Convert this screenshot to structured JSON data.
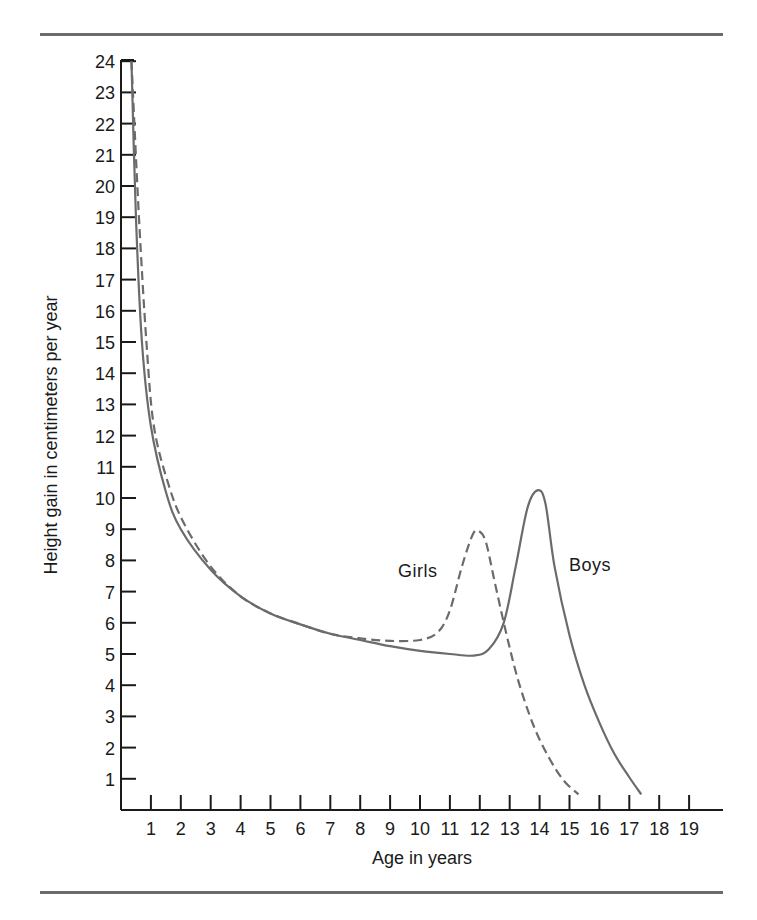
{
  "chart_data": {
    "type": "line",
    "title": "",
    "xlabel": "Age in years",
    "ylabel": "Height gain in centimeters per year",
    "xlim": [
      0,
      20
    ],
    "ylim": [
      0,
      24
    ],
    "x_ticks": [
      1,
      2,
      3,
      4,
      5,
      6,
      7,
      8,
      9,
      10,
      11,
      12,
      13,
      14,
      15,
      16,
      17,
      18,
      19
    ],
    "y_ticks": [
      1,
      2,
      3,
      4,
      5,
      6,
      7,
      8,
      9,
      10,
      11,
      12,
      13,
      14,
      15,
      16,
      17,
      18,
      19,
      20,
      21,
      22,
      23,
      24
    ],
    "grid": false,
    "legend": "inline labels",
    "series": [
      {
        "name": "Boys",
        "style": "solid",
        "color": "#6b6b6b",
        "label_pos": {
          "x": 15.8,
          "y": 7.6
        },
        "points": [
          [
            0.35,
            24
          ],
          [
            0.5,
            19
          ],
          [
            0.7,
            15
          ],
          [
            1.0,
            12.3
          ],
          [
            1.5,
            10.2
          ],
          [
            2.0,
            9.0
          ],
          [
            3.0,
            7.7
          ],
          [
            4.0,
            6.85
          ],
          [
            5.0,
            6.3
          ],
          [
            6.0,
            5.95
          ],
          [
            7.0,
            5.65
          ],
          [
            8.0,
            5.45
          ],
          [
            9.0,
            5.25
          ],
          [
            10.0,
            5.1
          ],
          [
            11.0,
            5.0
          ],
          [
            11.8,
            4.95
          ],
          [
            12.3,
            5.15
          ],
          [
            12.8,
            6.0
          ],
          [
            13.2,
            7.8
          ],
          [
            13.6,
            9.7
          ],
          [
            13.95,
            10.25
          ],
          [
            14.2,
            9.8
          ],
          [
            14.5,
            7.8
          ],
          [
            15.0,
            5.6
          ],
          [
            15.5,
            4.0
          ],
          [
            16.0,
            2.8
          ],
          [
            16.5,
            1.8
          ],
          [
            17.0,
            1.05
          ],
          [
            17.4,
            0.5
          ]
        ]
      },
      {
        "name": "Girls",
        "style": "dashed",
        "color": "#6b6b6b",
        "label_pos": {
          "x": 9.3,
          "y": 7.6
        },
        "points": [
          [
            0.35,
            24
          ],
          [
            0.6,
            19
          ],
          [
            0.85,
            15
          ],
          [
            1.1,
            12.3
          ],
          [
            1.6,
            10.4
          ],
          [
            2.1,
            9.2
          ],
          [
            3.0,
            7.8
          ],
          [
            4.0,
            6.85
          ],
          [
            5.0,
            6.3
          ],
          [
            6.0,
            5.95
          ],
          [
            7.0,
            5.65
          ],
          [
            8.0,
            5.5
          ],
          [
            9.0,
            5.42
          ],
          [
            10.0,
            5.45
          ],
          [
            10.6,
            5.7
          ],
          [
            11.0,
            6.4
          ],
          [
            11.4,
            7.8
          ],
          [
            11.75,
            8.8
          ],
          [
            11.95,
            8.95
          ],
          [
            12.2,
            8.6
          ],
          [
            12.5,
            7.3
          ],
          [
            12.9,
            5.6
          ],
          [
            13.3,
            4.1
          ],
          [
            13.8,
            2.7
          ],
          [
            14.3,
            1.7
          ],
          [
            14.8,
            0.95
          ],
          [
            15.3,
            0.5
          ]
        ]
      }
    ]
  },
  "axes": {
    "x_title": "Age in years",
    "y_title": "Height gain in centimeters per year"
  },
  "labels": {
    "girls": "Girls",
    "boys": "Boys"
  }
}
